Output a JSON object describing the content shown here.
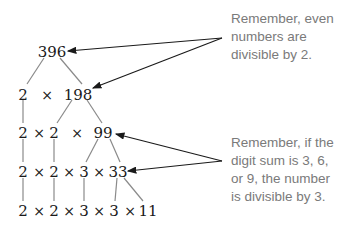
{
  "factor_tree": {
    "root": "396",
    "rows": [
      {
        "items": [
          "2",
          "×",
          "198"
        ]
      },
      {
        "items": [
          "2",
          "×",
          "2",
          "×",
          "99"
        ]
      },
      {
        "items": [
          "2",
          "×",
          "2",
          "×",
          "3",
          "×",
          "33"
        ]
      },
      {
        "items": [
          "2",
          "×",
          "2",
          "×",
          "3",
          "×",
          "3",
          "×",
          "11"
        ]
      }
    ]
  },
  "notes": [
    {
      "lines": [
        "Remember, even",
        "numbers are",
        "divisible by 2."
      ],
      "points_to": [
        "396",
        "198"
      ]
    },
    {
      "lines": [
        "Remember, if the",
        "digit sum is 3, 6,",
        "or 9, the number",
        "is divisible by 3."
      ],
      "points_to": [
        "99",
        "33"
      ]
    }
  ],
  "colors": {
    "text": "#1a1a1a",
    "note_text": "#7a7a7a",
    "branch_line": "#8a8a8a",
    "arrow": "#1a1a1a"
  }
}
